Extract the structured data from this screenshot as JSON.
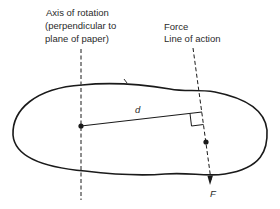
{
  "diagram": {
    "type": "moment-of-force",
    "labels": {
      "axis_line1": "Axis of rotation",
      "axis_line2": "(perpendicular to",
      "axis_line3": "plane of paper)",
      "force_line1": "Force",
      "force_line2": "Line of action",
      "distance": "d",
      "force_symbol": "F"
    },
    "colors": {
      "ink": "#1a1a1a",
      "background": "#ffffff"
    }
  }
}
